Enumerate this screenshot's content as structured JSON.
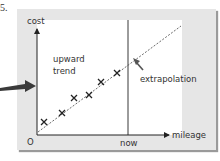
{
  "figure": {
    "number_label": "5.",
    "top_fragment": "a w"
  },
  "diagram": {
    "y_axis_label": "cost",
    "x_axis_label": "mileage",
    "origin_label": "O",
    "now_label": "now",
    "trend_label_line1": "upward",
    "trend_label_line2": "trend",
    "extrapolation_label": "extrapolation",
    "colors": {
      "panel": "#e6e6e6",
      "plot_area": "#ffffff",
      "axis": "#222222",
      "trend_line": "#444444",
      "pointer_arrow": "#3a3a3a"
    },
    "data_points": [
      {
        "x": 44,
        "y": 122
      },
      {
        "x": 62,
        "y": 113
      },
      {
        "x": 74,
        "y": 98
      },
      {
        "x": 89,
        "y": 95
      },
      {
        "x": 101,
        "y": 82
      },
      {
        "x": 117,
        "y": 73
      }
    ]
  }
}
